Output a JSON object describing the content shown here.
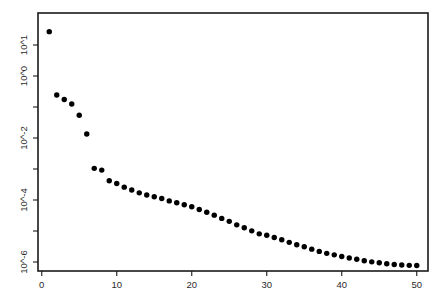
{
  "chart_data": {
    "type": "scatter",
    "title": "",
    "xlabel": "",
    "ylabel": "",
    "yscale": "log",
    "xscale": "linear",
    "grid": false,
    "legend": null,
    "xlim": [
      -0.5,
      51.5
    ],
    "ylim": [
      1e-07,
      60
    ],
    "xticks": [
      0,
      10,
      20,
      30,
      40,
      50
    ],
    "xtick_labels": [
      "0",
      "10",
      "20",
      "30",
      "40",
      "50"
    ],
    "yticks": [
      10,
      1,
      0.01,
      0.0001,
      1e-06
    ],
    "ytick_labels": [
      "10^1",
      "10^0",
      "10^-2",
      "10^-4",
      "10^-6"
    ],
    "yminor_ticks": [
      0.1,
      0.001,
      1e-05
    ],
    "marker": "filled-circle",
    "marker_color": "#000000",
    "marker_size": 4.2,
    "n_points": 50,
    "x": [
      1,
      2,
      3,
      4,
      5,
      6,
      7,
      8,
      9,
      10,
      11,
      12,
      13,
      14,
      15,
      16,
      17,
      18,
      19,
      20,
      21,
      22,
      23,
      24,
      25,
      26,
      27,
      28,
      29,
      30,
      31,
      32,
      33,
      34,
      35,
      36,
      37,
      38,
      39,
      40,
      41,
      42,
      43,
      44,
      45,
      46,
      47,
      48,
      49,
      50
    ],
    "y": [
      27.0,
      0.245,
      0.175,
      0.125,
      0.054,
      0.0135,
      0.00105,
      0.00092,
      0.00042,
      0.00034,
      0.00026,
      0.00021,
      0.00017,
      0.000145,
      0.000128,
      0.000112,
      9.35e-05,
      8.15e-05,
      7.05e-05,
      6.05e-05,
      4.95e-05,
      4.05e-05,
      3.25e-05,
      2.55e-05,
      2.05e-05,
      1.58e-05,
      1.28e-05,
      1.01e-05,
      8.1e-06,
      7.3e-06,
      6.2e-06,
      5.2e-06,
      4.3e-06,
      3.6e-06,
      3.1e-06,
      2.6e-06,
      2.2e-06,
      1.9e-06,
      1.7e-06,
      1.5e-06,
      1.35e-06,
      1.22e-06,
      1.1e-06,
      1.01e-06,
      9.4e-07,
      8.8e-07,
      8.3e-07,
      8e-07,
      7.8e-07,
      7.7e-07
    ]
  },
  "axes": {
    "frame_color": "#1a1a1a"
  }
}
